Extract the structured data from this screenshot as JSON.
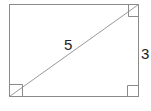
{
  "diagram": {
    "shape": "rectangle",
    "diagonal_label": "5",
    "side_label": "3",
    "stroke_color": "#8a8a8a",
    "label_color": "#222222",
    "right_angle_markers": [
      "bottom-left",
      "top-right",
      "bottom-right"
    ]
  }
}
